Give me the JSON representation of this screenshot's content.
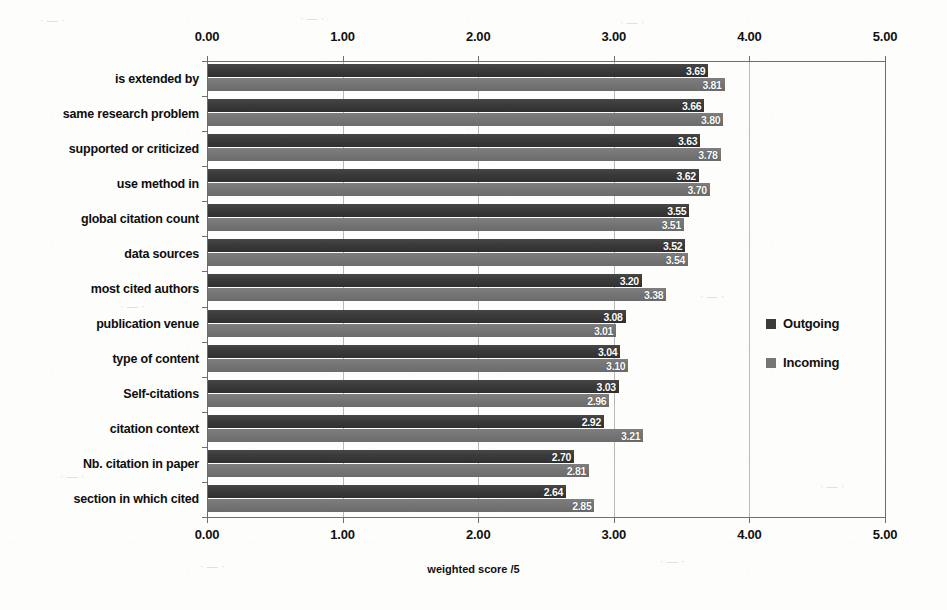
{
  "chart_data": {
    "type": "bar",
    "orientation": "horizontal",
    "title": "",
    "xlabel": "weighted score /5",
    "ylabel": "",
    "xlim": [
      0,
      5
    ],
    "xticks": [
      "0.00",
      "1.00",
      "2.00",
      "3.00",
      "4.00",
      "5.00"
    ],
    "xtick_values": [
      0,
      1,
      2,
      3,
      4,
      5
    ],
    "grid": true,
    "dual_axis": true,
    "legend_position": "right",
    "categories": [
      "is extended by",
      "same research problem",
      "supported or criticized",
      "use method in",
      "global citation count",
      "data sources",
      "most cited authors",
      "publication venue",
      "type of content",
      "Self-citations",
      "citation context",
      "Nb. citation in paper",
      "section in which cited"
    ],
    "series": [
      {
        "name": "Outgoing",
        "color": "#3b3b3b",
        "values": [
          3.69,
          3.66,
          3.63,
          3.62,
          3.55,
          3.52,
          3.2,
          3.08,
          3.04,
          3.03,
          2.92,
          2.7,
          2.64
        ],
        "labels": [
          "3.69",
          "3.66",
          "3.63",
          "3.62",
          "3.55",
          "3.52",
          "3.20",
          "3.08",
          "3.04",
          "3.03",
          "2.92",
          "2.70",
          "2.64"
        ]
      },
      {
        "name": "Incoming",
        "color": "#767676",
        "values": [
          3.81,
          3.8,
          3.78,
          3.7,
          3.51,
          3.54,
          3.38,
          3.01,
          3.1,
          2.96,
          3.21,
          2.81,
          2.85
        ],
        "labels": [
          "3.81",
          "3.80",
          "3.78",
          "3.70",
          "3.51",
          "3.54",
          "3.38",
          "3.01",
          "3.10",
          "2.96",
          "3.21",
          "2.81",
          "2.85"
        ]
      }
    ]
  },
  "legend": {
    "items": [
      {
        "label": "Outgoing",
        "swatch": "outgoing"
      },
      {
        "label": "Incoming",
        "swatch": "incoming"
      }
    ]
  }
}
